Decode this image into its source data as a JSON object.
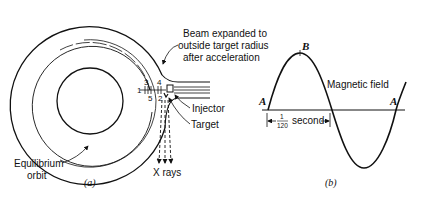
{
  "figure_a": {
    "caption": "(a)",
    "labels": {
      "beam_line1": "Beam expanded to",
      "beam_line2": "outside target radius",
      "beam_line3": "after acceleration",
      "injector": "Injector",
      "target": "Target",
      "equilibrium_line1": "Equilibrium",
      "equilibrium_line2": "orbit",
      "xrays": "X rays"
    },
    "orbit_numbers": [
      "1",
      "2",
      "3",
      "4",
      "5"
    ]
  },
  "figure_b": {
    "caption": "(b)",
    "labels": {
      "point_a_left": "A",
      "point_b": "B",
      "point_a_right": "A",
      "magnetic_field": "Magnetic field",
      "fraction_numerator": "1",
      "fraction_denominator": "120",
      "second": "second"
    }
  },
  "colors": {
    "ink": "#111111",
    "background": "#ffffff"
  }
}
